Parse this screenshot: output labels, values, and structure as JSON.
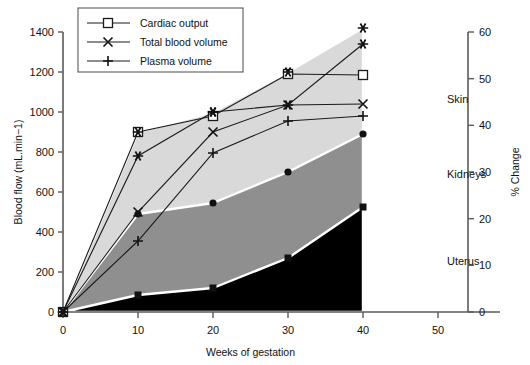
{
  "chart_data": {
    "type": "area",
    "title": "",
    "xlabel": "Weeks of gestation",
    "ylabel": "Blood flow (mL.min−1)",
    "y2label": "% Change",
    "xlim": [
      0,
      50
    ],
    "ylim": [
      0,
      1400
    ],
    "y2lim": [
      0,
      60
    ],
    "grid": false,
    "x": [
      0,
      10,
      20,
      30,
      40
    ],
    "xticks": [
      "0",
      "10",
      "20",
      "30",
      "40",
      "50"
    ],
    "xtick_values": [
      0,
      10,
      20,
      30,
      40,
      50
    ],
    "yticks": [
      "0",
      "200",
      "400",
      "600",
      "800",
      "1000",
      "1200",
      "1400"
    ],
    "ytick_values": [
      0,
      200,
      400,
      600,
      800,
      1000,
      1200,
      1400
    ],
    "y2ticks": [
      "0",
      "10",
      "20",
      "30",
      "40",
      "50",
      "60"
    ],
    "y2tick_values": [
      0,
      10,
      20,
      30,
      40,
      50,
      60
    ],
    "legend_position": "top-left",
    "stacked_areas": [
      {
        "name": "Uterus",
        "label": "Uterus",
        "color": "#000000",
        "cumulative_values": [
          0,
          85,
          120,
          270,
          525
        ],
        "marker": "square-filled"
      },
      {
        "name": "Kidneys",
        "label": "Kidneys",
        "color": "#8f8f8f",
        "cumulative_values": [
          0,
          490,
          545,
          700,
          890
        ],
        "marker": "circle-filled"
      },
      {
        "name": "Skin",
        "label": "Skin",
        "color": "#d9d9d9",
        "cumulative_values": [
          0,
          900,
          1000,
          1200,
          1420
        ],
        "marker": "star"
      }
    ],
    "series": [
      {
        "name": "Cardiac output",
        "marker": "open-square",
        "values": [
          0,
          900,
          980,
          1190,
          1185
        ]
      },
      {
        "name": "Total blood volume",
        "marker": "cross-x",
        "values": [
          0,
          500,
          900,
          1035,
          1040
        ]
      },
      {
        "name": "Plasma volume",
        "marker": "plus",
        "values": [
          0,
          355,
          795,
          955,
          980
        ]
      },
      {
        "name": "Skin flow marker",
        "marker": "star",
        "values": [
          0,
          780,
          1000,
          1035,
          1340
        ]
      }
    ],
    "legend": [
      {
        "label": "Cardiac output",
        "marker": "open-square"
      },
      {
        "label": "Total blood volume",
        "marker": "cross-x"
      },
      {
        "label": "Plasma volume",
        "marker": "plus"
      }
    ],
    "band_labels": [
      {
        "label": "Skin"
      },
      {
        "label": "Kidneys"
      },
      {
        "label": "Uterus"
      }
    ]
  }
}
